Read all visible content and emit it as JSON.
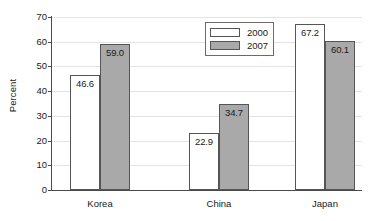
{
  "chart_data": {
    "type": "bar",
    "title": "",
    "subtitle": "",
    "xlabel": "",
    "ylabel": "Percent",
    "categories": [
      "Korea",
      "China",
      "Japan"
    ],
    "series": [
      {
        "name": "2000",
        "values": [
          46.6,
          22.9,
          67.2
        ],
        "color": "#ffffff"
      },
      {
        "name": "2007",
        "values": [
          59.0,
          34.7,
          60.1
        ],
        "color": "#a9a9a9"
      }
    ],
    "value_labels": [
      [
        "46.6",
        "22.9",
        "67.2"
      ],
      [
        "59.0",
        "34.7",
        "60.1"
      ]
    ],
    "ylim": [
      0,
      70
    ],
    "ytick_values": [
      0,
      10,
      20,
      30,
      40,
      50,
      60,
      70
    ],
    "ytick_labels": [
      "0",
      "10",
      "20",
      "30",
      "40",
      "50",
      "60",
      "70"
    ],
    "grid": true,
    "grid_axis": "y",
    "legend_position": "top-center",
    "legend_entries": [
      "2000",
      "2007"
    ],
    "bar_border_color": "#555555",
    "axis_color": "#4a4a4a",
    "gridline_color": "#e3e3e3"
  }
}
